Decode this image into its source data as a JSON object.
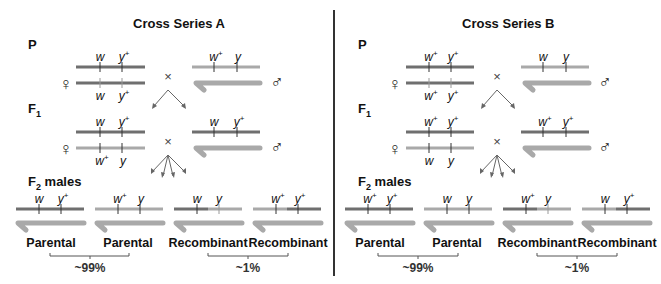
{
  "colors": {
    "dark_chromosome": "#6f6f6f",
    "light_chromosome": "#a9a9a9",
    "y_chromosome": "#a9a9a9",
    "tick": "#333333",
    "text": "#111111"
  },
  "panels": [
    {
      "title": "Cross Series A",
      "generations": {
        "p": "P",
        "f1": "F",
        "f1_sub": "1",
        "f2": "F",
        "f2_sub": "2",
        "f2_suffix": " males"
      },
      "symbols": {
        "female": "♀",
        "male": "♂",
        "cross": "×"
      },
      "p": {
        "female_top": [
          "w",
          "",
          "y",
          "+"
        ],
        "female_bottom": [
          "w",
          "",
          "y",
          "+"
        ],
        "male_x": [
          "w",
          "+",
          "y",
          ""
        ]
      },
      "f1": {
        "female_top": [
          "w",
          "",
          "y",
          "+"
        ],
        "female_bottom": [
          "w",
          "+",
          "y",
          ""
        ],
        "male_x": [
          "w",
          "",
          "y",
          "+"
        ]
      },
      "f2": [
        {
          "alleles": [
            "w",
            "",
            "y",
            "+"
          ],
          "label": "Parental"
        },
        {
          "alleles": [
            "w",
            "+",
            "y",
            ""
          ],
          "label": "Parental"
        },
        {
          "alleles": [
            "w",
            "",
            "y",
            ""
          ],
          "label": "Recombinant"
        },
        {
          "alleles": [
            "w",
            "+",
            "y",
            "+"
          ],
          "label": "Recombinant"
        }
      ],
      "parental_pct": "~99%",
      "recombinant_pct": "~1%"
    },
    {
      "title": "Cross Series B",
      "generations": {
        "p": "P",
        "f1": "F",
        "f1_sub": "1",
        "f2": "F",
        "f2_sub": "2",
        "f2_suffix": " males"
      },
      "symbols": {
        "female": "♀",
        "male": "♂",
        "cross": "×"
      },
      "p": {
        "female_top": [
          "w",
          "+",
          "y",
          "+"
        ],
        "female_bottom": [
          "w",
          "+",
          "y",
          "+"
        ],
        "male_x": [
          "w",
          "",
          "y",
          ""
        ]
      },
      "f1": {
        "female_top": [
          "w",
          "+",
          "y",
          "+"
        ],
        "female_bottom": [
          "w",
          "",
          "y",
          ""
        ],
        "male_x": [
          "w",
          "+",
          "y",
          "+"
        ]
      },
      "f2": [
        {
          "alleles": [
            "w",
            "+",
            "y",
            "+"
          ],
          "label": "Parental"
        },
        {
          "alleles": [
            "w",
            "",
            "y",
            ""
          ],
          "label": "Parental"
        },
        {
          "alleles": [
            "w",
            "+",
            "y",
            ""
          ],
          "label": "Recombinant"
        },
        {
          "alleles": [
            "w",
            "",
            "y",
            "+"
          ],
          "label": "Recombinant"
        }
      ],
      "parental_pct": "~99%",
      "recombinant_pct": "~1%"
    }
  ]
}
